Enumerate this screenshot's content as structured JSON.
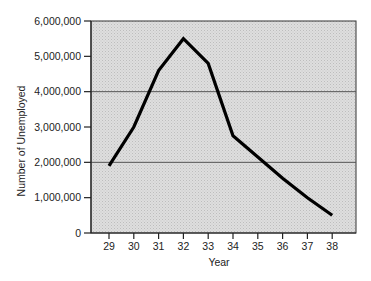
{
  "chart_data": {
    "type": "line",
    "title": "",
    "xlabel": "Year",
    "ylabel": "Number of Unemployed",
    "categories": [
      "29",
      "30",
      "31",
      "32",
      "33",
      "34",
      "35",
      "36",
      "37",
      "38"
    ],
    "values": [
      1900000,
      3000000,
      4600000,
      5500000,
      4800000,
      2750000,
      2150000,
      1550000,
      1000000,
      500000
    ],
    "ylim": [
      0,
      6000000
    ],
    "yticks": [
      0,
      1000000,
      2000000,
      3000000,
      4000000,
      5000000,
      6000000
    ],
    "ytick_labels": [
      "0",
      "1,000,000",
      "2,000,000",
      "3,000,000",
      "4,000,000",
      "5,000,000",
      "6,000,000"
    ],
    "grid": {
      "horizontal_lines_at": [
        2000000,
        4000000
      ]
    },
    "legend": null,
    "colors": {
      "background": "#d9d9d9",
      "line": "#000000",
      "grid": "#555555"
    }
  },
  "axes": {
    "x_title": "Year",
    "y_title": "Number of Unemployed"
  }
}
